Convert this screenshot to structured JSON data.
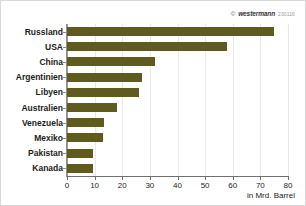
{
  "credit": {
    "symbol": "©",
    "brand": "westermann",
    "code": "230116"
  },
  "chart_data": {
    "type": "bar",
    "orientation": "horizontal",
    "title": "",
    "subtitle": "",
    "xlabel": "in Mrd. Barrel",
    "ylabel": "",
    "xlim": [
      0,
      80
    ],
    "xticks": [
      0,
      10,
      20,
      30,
      40,
      50,
      60,
      70,
      80
    ],
    "xticklabels": [
      "0",
      "10",
      "20",
      "30",
      "40",
      "50",
      "60",
      "70",
      "80"
    ],
    "grid": true,
    "grid_axis": "x",
    "legend": false,
    "legend_position": "none",
    "bar_color": "#5f5b1e",
    "categories": [
      "Russland",
      "USA",
      "China",
      "Argentinien",
      "Libyen",
      "Australien",
      "Venezuela",
      "Mexiko",
      "Pakistan",
      "Kanada"
    ],
    "values": [
      75,
      58,
      32,
      27,
      26,
      18,
      13.5,
      13,
      9.5,
      9.5
    ],
    "series": [
      {
        "name": "Reserven",
        "values": [
          75,
          58,
          32,
          27,
          26,
          18,
          13.5,
          13,
          9.5,
          9.5
        ]
      }
    ]
  }
}
